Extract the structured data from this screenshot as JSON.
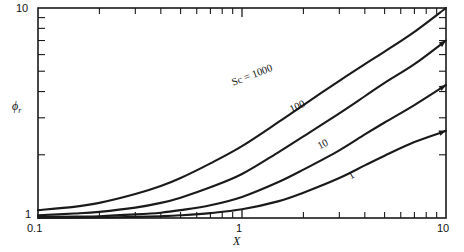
{
  "figure": {
    "background_color": "#ffffff",
    "line_color": "#1a1a1a"
  },
  "axes": {
    "x_title": "X",
    "y_title_symbol": "ϕ",
    "y_title_subscript": "r",
    "x_tick_labels": [
      "0.1",
      "1",
      "10"
    ],
    "y_tick_labels": [
      "1",
      "10"
    ]
  },
  "curve_labels": {
    "sc1000": "Sc = 1000",
    "sc100": "100",
    "sc10": "10",
    "sc1": "1"
  },
  "chart_data": {
    "type": "line",
    "title": "",
    "xlabel": "X",
    "ylabel": "ϕr",
    "xscale": "log",
    "yscale": "log",
    "xlim": [
      0.1,
      10
    ],
    "ylim": [
      1,
      10
    ],
    "grid": false,
    "legend": "inline-curve-labels",
    "x_major_ticks": [
      0.1,
      1,
      10
    ],
    "x_minor_ticks": [
      0.2,
      0.3,
      0.4,
      0.5,
      0.6,
      0.7,
      0.8,
      0.9,
      2,
      3,
      4,
      5,
      6,
      7,
      8,
      9
    ],
    "y_major_ticks": [
      1,
      10
    ],
    "y_minor_ticks": [
      2,
      3,
      4,
      5,
      6,
      7,
      8,
      9
    ],
    "series": [
      {
        "name": "Sc = 1000",
        "label": "Sc = 1000",
        "x": [
          0.1,
          0.15,
          0.2,
          0.3,
          0.4,
          0.5,
          0.7,
          1.0,
          1.5,
          2.0,
          3.0,
          4.0,
          5.0,
          7.0,
          10.0
        ],
        "y": [
          1.09,
          1.13,
          1.18,
          1.3,
          1.42,
          1.55,
          1.82,
          2.2,
          2.85,
          3.45,
          4.5,
          5.4,
          6.2,
          7.7,
          10.0
        ]
      },
      {
        "name": "Sc = 100",
        "label": "100",
        "x": [
          0.1,
          0.15,
          0.2,
          0.3,
          0.4,
          0.5,
          0.7,
          1.0,
          1.5,
          2.0,
          3.0,
          4.0,
          5.0,
          7.0,
          10.0
        ],
        "y": [
          1.03,
          1.05,
          1.07,
          1.12,
          1.18,
          1.25,
          1.4,
          1.62,
          2.05,
          2.45,
          3.15,
          3.8,
          4.4,
          5.4,
          7.0
        ]
      },
      {
        "name": "Sc = 10",
        "label": "10",
        "x": [
          0.1,
          0.15,
          0.2,
          0.3,
          0.4,
          0.5,
          0.7,
          1.0,
          1.5,
          2.0,
          3.0,
          4.0,
          5.0,
          7.0,
          10.0
        ],
        "y": [
          1.01,
          1.015,
          1.02,
          1.04,
          1.06,
          1.09,
          1.15,
          1.26,
          1.48,
          1.7,
          2.1,
          2.5,
          2.85,
          3.45,
          4.3
        ]
      },
      {
        "name": "Sc = 1",
        "label": "1",
        "x": [
          0.1,
          0.15,
          0.2,
          0.3,
          0.4,
          0.5,
          0.7,
          1.0,
          1.5,
          2.0,
          3.0,
          4.0,
          5.0,
          7.0,
          10.0
        ],
        "y": [
          1.002,
          1.004,
          1.006,
          1.012,
          1.02,
          1.03,
          1.055,
          1.1,
          1.2,
          1.32,
          1.55,
          1.78,
          1.98,
          2.3,
          2.6
        ]
      }
    ]
  }
}
